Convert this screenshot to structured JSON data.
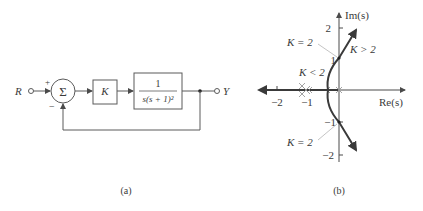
{
  "figure_a": {
    "caption": "(a)",
    "input_label": "R",
    "output_label": "Y",
    "sum_symbol": "Σ",
    "plus_sign": "+",
    "minus_sign": "−",
    "gain_label": "K",
    "plant_numerator": "1",
    "plant_denominator": "s(s + 1)²"
  },
  "figure_b": {
    "caption": "(b)",
    "axis_im_label": "Im(s)",
    "axis_re_label": "Re(s)",
    "im_ticks": [
      "2",
      "1",
      "−1",
      "−2"
    ],
    "re_ticks": [
      "−2",
      "−1"
    ],
    "annotations": {
      "k_eq_2_upper": "K = 2",
      "k_gt_2": "K > 2",
      "k_lt_2": "K < 2",
      "k_eq_2_lower": "K = 2"
    },
    "poles": [
      "0",
      "−1 (double)"
    ],
    "crossing_points": [
      "+j1",
      "−j1"
    ]
  },
  "colors": {
    "line": "#5a5a5a",
    "locus": "#3a3a3a",
    "axis": "#4a4a4a",
    "pole_marker": "#9a9a9a",
    "leader": "#aaaaaa"
  }
}
